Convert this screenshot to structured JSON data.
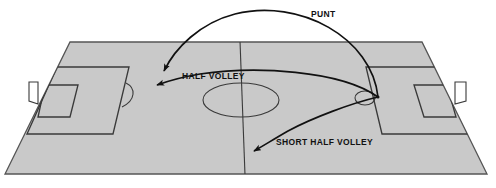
{
  "diagram": {
    "field": {
      "surface_color": "#c9c9c9",
      "line_color": "#3a3a3a",
      "outline_color": "#555555",
      "goal_fill_color": "#ffffff",
      "background_color": "#ffffff",
      "halfway_line": true,
      "center_circle": true,
      "penalty_areas": 2,
      "goal_areas": 2,
      "goals": 2
    },
    "kick_origin": {
      "x": 378,
      "y": 97,
      "description": "goalkeeper kick point"
    },
    "trajectories": [
      {
        "id": "punt",
        "label": "PUNT",
        "label_x": 311,
        "label_y": 9,
        "arrow_color": "#111111",
        "start_x": 378,
        "start_y": 97,
        "end_x": 163,
        "end_y": 73,
        "apex_y": 8,
        "description": "high arcing punt across the field"
      },
      {
        "id": "half-volley",
        "label": "HALF VOLLEY",
        "label_x": 182,
        "label_y": 71,
        "arrow_color": "#111111",
        "start_x": 378,
        "start_y": 97,
        "end_x": 155,
        "end_y": 86,
        "apex_y": 70,
        "description": "flat driven half volley to far third"
      },
      {
        "id": "short-half-volley",
        "label": "SHORT HALF VOLLEY",
        "label_x": 276,
        "label_y": 137,
        "arrow_color": "#111111",
        "start_x": 378,
        "start_y": 97,
        "end_x": 252,
        "end_y": 152,
        "apex_y": 118,
        "description": "short lower half volley toward near side"
      }
    ]
  }
}
